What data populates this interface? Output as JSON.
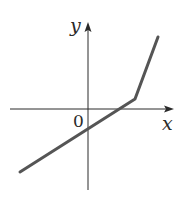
{
  "chart_data": {
    "type": "line",
    "title": "",
    "xlabel": "x",
    "ylabel": "y",
    "origin_label": "0",
    "grid": false,
    "legend": null,
    "axis_ticks": "none (unlabeled axes; only origin marked)",
    "units_note": "coordinates estimated in arbitrary units (~20px per unit)",
    "xlim": [
      -3.9,
      4.2
    ],
    "ylim": [
      -4.0,
      4.4
    ],
    "series": [
      {
        "name": "piecewise linear function",
        "color": "#555555",
        "points": [
          {
            "x": -3.4,
            "y": -3.15
          },
          {
            "x": 2.35,
            "y": 0.5
          },
          {
            "x": 3.5,
            "y": 3.6
          }
        ]
      }
    ],
    "annotations": {
      "kink_point": {
        "x": 2.35,
        "y": 0.5
      },
      "y_intercept": -0.6,
      "x_intercept": 1.1,
      "left_segment_slope": 0.63,
      "right_segment_slope": 2.7
    }
  },
  "labels": {
    "x_axis": "x",
    "y_axis": "y",
    "origin": "0"
  },
  "colors": {
    "axis": "#2a2a2a",
    "curve": "#555555",
    "background": "#ffffff"
  }
}
